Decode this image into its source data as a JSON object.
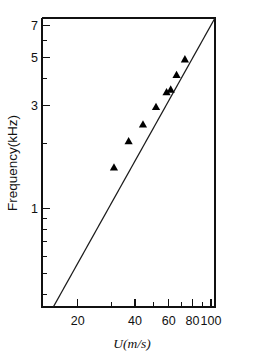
{
  "chart_data": {
    "type": "scatter",
    "title": "",
    "subtitle": "",
    "xlabel": "U(m/s)",
    "ylabel": "Frequency(kHz)",
    "xscale": "log",
    "yscale": "log",
    "xlim": [
      13,
      105
    ],
    "ylim": [
      0.35,
      7.6
    ],
    "grid": false,
    "legend": null,
    "x_tick_labels": [
      "20",
      "40",
      "60",
      "80",
      "100"
    ],
    "x_tick_values": [
      20,
      40,
      60,
      80,
      100
    ],
    "y_tick_labels": [
      "1",
      "3",
      "5",
      "7"
    ],
    "y_tick_values": [
      1,
      3,
      5,
      7
    ],
    "x_minor_ticks": [
      14,
      15,
      16,
      17,
      18,
      19,
      30,
      50,
      70,
      90
    ],
    "y_minor_ticks": [
      0.4,
      0.5,
      0.6,
      0.7,
      0.8,
      0.9,
      2,
      4,
      6
    ],
    "series": [
      {
        "name": "measured",
        "marker": "triangle-up",
        "color": "#000000",
        "points": [
          {
            "x": 31.0,
            "y": 1.55
          },
          {
            "x": 37.0,
            "y": 2.05
          },
          {
            "x": 44.0,
            "y": 2.45
          },
          {
            "x": 51.5,
            "y": 2.95
          },
          {
            "x": 58.5,
            "y": 3.45
          },
          {
            "x": 61.5,
            "y": 3.55
          },
          {
            "x": 66.0,
            "y": 4.15
          },
          {
            "x": 73.0,
            "y": 4.9
          }
        ]
      },
      {
        "name": "fit-line",
        "marker": "none",
        "color": "#1a1a1a",
        "points": [
          {
            "x": 14.9,
            "y": 0.35
          },
          {
            "x": 105.0,
            "y": 7.6
          }
        ]
      }
    ]
  },
  "axes": {
    "x_title": "U(m/s)",
    "y_title": "Frequency(kHz)"
  }
}
